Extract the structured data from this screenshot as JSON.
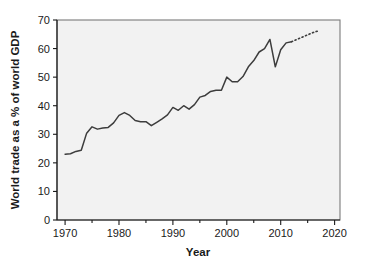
{
  "chart_data": {
    "type": "line",
    "title": "",
    "xlabel": "Year",
    "ylabel": "World trade as a % of world GDP",
    "xlim": [
      1968.5,
      2021
    ],
    "ylim": [
      0,
      70
    ],
    "xticks": [
      1970,
      1980,
      1990,
      2000,
      2010,
      2020
    ],
    "xtick_labels": [
      "1970",
      "1980",
      "1990",
      "2000",
      "2010",
      "2020"
    ],
    "xminor_ticks": [
      1975,
      1985,
      1995,
      2005,
      2015
    ],
    "yticks": [
      0,
      10,
      20,
      30,
      40,
      50,
      60,
      70
    ],
    "ytick_labels": [
      "0",
      "10",
      "20",
      "30",
      "40",
      "50",
      "60",
      "70"
    ],
    "grid": false,
    "legend": false,
    "series": [
      {
        "name": "World trade as a % of world GDP",
        "style": "solid",
        "color": "#3d3d3d",
        "x": [
          1970,
          1971,
          1972,
          1973,
          1974,
          1975,
          1976,
          1977,
          1978,
          1979,
          1980,
          1981,
          1982,
          1983,
          1984,
          1985,
          1986,
          1987,
          1988,
          1989,
          1990,
          1991,
          1992,
          1993,
          1994,
          1995,
          1996,
          1997,
          1998,
          1999,
          2000,
          2001,
          2002,
          2003,
          2004,
          2005,
          2006,
          2007,
          2008,
          2009,
          2010,
          2011,
          2012
        ],
        "y": [
          23.0,
          23.2,
          24.0,
          24.4,
          30.4,
          32.6,
          31.8,
          32.2,
          32.4,
          34.0,
          36.6,
          37.6,
          36.6,
          34.8,
          34.4,
          34.4,
          33.0,
          34.2,
          35.4,
          36.8,
          39.4,
          38.4,
          40.0,
          38.8,
          40.4,
          43.0,
          43.6,
          45.0,
          45.4,
          45.4,
          50.0,
          48.4,
          48.4,
          50.2,
          53.6,
          55.8,
          58.8,
          60.0,
          63.2,
          53.6,
          59.6,
          62.0,
          62.4
        ]
      },
      {
        "name": "Projection",
        "style": "dotted",
        "color": "#3d3d3d",
        "x": [
          2012,
          2013,
          2014,
          2015,
          2016,
          2017
        ],
        "y": [
          62.4,
          63.2,
          64.0,
          64.8,
          65.6,
          66.2
        ]
      }
    ]
  }
}
